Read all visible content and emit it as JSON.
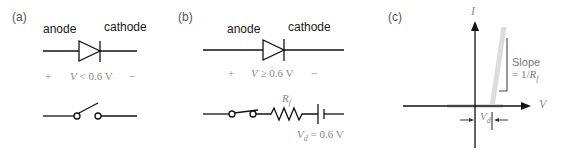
{
  "panels": {
    "a": {
      "label": "(a)",
      "anode": "anode",
      "cathode": "cathode",
      "plus": "+",
      "minus": "−",
      "condition_var": "V",
      "condition_rest": " < 0.6 V"
    },
    "b": {
      "label": "(b)",
      "anode": "anode",
      "cathode": "cathode",
      "plus": "+",
      "minus": "−",
      "condition_var": "V",
      "condition_rest": " ≥ 0.6 V",
      "resistor_label": "R",
      "resistor_sub": "f",
      "source_var": "V",
      "source_sub": "d",
      "source_rest": " = 0.6 V"
    },
    "c": {
      "label": "(c)",
      "y_axis": "I",
      "x_axis": "V",
      "slope_line1": "Slope",
      "slope_line2_prefix": "= 1/",
      "slope_var": "R",
      "slope_sub": "f",
      "vd_var": "V",
      "vd_sub": "d"
    }
  },
  "colors": {
    "line": "#111111",
    "grey_text": "#8a8a8a",
    "curve": "#d8d8d8"
  }
}
